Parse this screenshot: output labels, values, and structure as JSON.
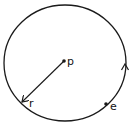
{
  "diagram": {
    "type": "circle-with-radius",
    "center_label": "p",
    "radius_label": "r",
    "point_label": "e",
    "direction": "counterclockwise",
    "colors": {
      "stroke": "#1a1a1a",
      "background": "#ffffff"
    }
  }
}
